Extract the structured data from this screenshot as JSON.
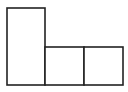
{
  "diagram": {
    "stroke_color": "#222222",
    "fill_color": "#ffffff",
    "stroke_width": 1.6,
    "shapes": [
      {
        "id": "tall-rect",
        "x": 7,
        "y": 8,
        "width": 38,
        "height": 77
      },
      {
        "id": "square-1",
        "x": 45,
        "y": 47,
        "width": 39,
        "height": 38
      },
      {
        "id": "square-2",
        "x": 84,
        "y": 47,
        "width": 39,
        "height": 38
      }
    ]
  }
}
